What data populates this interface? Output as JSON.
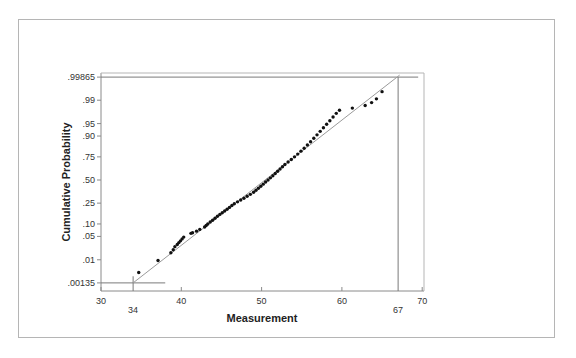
{
  "chart_data": {
    "type": "scatter",
    "subtype": "normal-probability-plot",
    "title": "",
    "xlabel": "Measurement",
    "ylabel": "Cumulative Probability",
    "xlim": [
      30,
      70
    ],
    "x_ticks": [
      30,
      40,
      50,
      60,
      70
    ],
    "x_extra_labels": [
      34,
      67
    ],
    "y_scale": "probit",
    "y_ticks": [
      {
        "label": ".99865",
        "p": 0.99865
      },
      {
        "label": ".99",
        "p": 0.99
      },
      {
        "label": ".95",
        "p": 0.95
      },
      {
        "label": ".90",
        "p": 0.9
      },
      {
        "label": ".75",
        "p": 0.75
      },
      {
        "label": ".50",
        "p": 0.5
      },
      {
        "label": ".25",
        "p": 0.25
      },
      {
        "label": ".10",
        "p": 0.1
      },
      {
        "label": ".05",
        "p": 0.05
      },
      {
        "label": ".01",
        "p": 0.01
      },
      {
        "label": ".00135",
        "p": 0.00135
      }
    ],
    "grid": false,
    "legend": null,
    "reference_line": {
      "from": {
        "x": 34,
        "p": 0.00135
      },
      "to": {
        "x": 67,
        "p": 0.99865
      }
    },
    "reference_guides": [
      {
        "type": "horizontal",
        "p": 0.99865,
        "x_from": 30,
        "x_to": 69.5
      },
      {
        "type": "horizontal",
        "p": 0.00135,
        "x_from": 30,
        "x_to": 38
      },
      {
        "type": "vertical",
        "x": 34,
        "p_from": "axis",
        "p_to": 0.0025
      },
      {
        "type": "vertical",
        "x": 67,
        "p_from": "axis",
        "p_to": 0.99865
      }
    ],
    "points": [
      [
        34.7,
        0.0035
      ],
      [
        37.1,
        0.0095
      ],
      [
        38.7,
        0.017
      ],
      [
        39.0,
        0.021
      ],
      [
        39.2,
        0.026
      ],
      [
        39.5,
        0.03
      ],
      [
        39.7,
        0.034
      ],
      [
        39.9,
        0.038
      ],
      [
        40.1,
        0.043
      ],
      [
        40.3,
        0.048
      ],
      [
        41.2,
        0.06
      ],
      [
        41.4,
        0.062
      ],
      [
        41.9,
        0.068
      ],
      [
        42.3,
        0.075
      ],
      [
        42.9,
        0.085
      ],
      [
        43.1,
        0.092
      ],
      [
        43.3,
        0.1
      ],
      [
        43.6,
        0.11
      ],
      [
        43.9,
        0.12
      ],
      [
        44.2,
        0.132
      ],
      [
        44.5,
        0.145
      ],
      [
        44.8,
        0.158
      ],
      [
        45.1,
        0.17
      ],
      [
        45.4,
        0.183
      ],
      [
        45.7,
        0.197
      ],
      [
        46.0,
        0.212
      ],
      [
        46.3,
        0.228
      ],
      [
        46.6,
        0.245
      ],
      [
        47.0,
        0.262
      ],
      [
        47.4,
        0.28
      ],
      [
        47.8,
        0.298
      ],
      [
        48.2,
        0.318
      ],
      [
        48.6,
        0.338
      ],
      [
        49.0,
        0.36
      ],
      [
        49.3,
        0.382
      ],
      [
        49.6,
        0.405
      ],
      [
        49.9,
        0.428
      ],
      [
        50.2,
        0.452
      ],
      [
        50.5,
        0.476
      ],
      [
        50.8,
        0.5
      ],
      [
        51.1,
        0.525
      ],
      [
        51.4,
        0.55
      ],
      [
        51.7,
        0.575
      ],
      [
        52.0,
        0.6
      ],
      [
        52.3,
        0.625
      ],
      [
        52.6,
        0.65
      ],
      [
        52.9,
        0.675
      ],
      [
        53.3,
        0.7
      ],
      [
        53.7,
        0.725
      ],
      [
        54.1,
        0.75
      ],
      [
        54.5,
        0.775
      ],
      [
        54.9,
        0.8
      ],
      [
        55.3,
        0.823
      ],
      [
        55.7,
        0.846
      ],
      [
        56.1,
        0.868
      ],
      [
        56.5,
        0.888
      ],
      [
        56.9,
        0.906
      ],
      [
        57.3,
        0.922
      ],
      [
        57.7,
        0.936
      ],
      [
        58.1,
        0.948
      ],
      [
        58.5,
        0.958
      ],
      [
        58.9,
        0.967
      ],
      [
        59.3,
        0.974
      ],
      [
        59.7,
        0.979
      ],
      [
        61.3,
        0.982
      ],
      [
        62.9,
        0.985
      ],
      [
        63.7,
        0.988
      ],
      [
        64.3,
        0.991
      ],
      [
        65.0,
        0.995
      ]
    ]
  },
  "axes": {
    "x_title": "Measurement",
    "y_title": "Cumulative Probability",
    "x_tick_labels": [
      "30",
      "40",
      "50",
      "60",
      "70"
    ],
    "x_extra_labels": [
      "34",
      "67"
    ],
    "y_tick_labels": [
      ".99865",
      ".99",
      ".95",
      ".90",
      ".75",
      ".50",
      ".25",
      ".10",
      ".05",
      ".01",
      ".00135"
    ]
  },
  "colors": {
    "axis": "#8a8a8a",
    "points": "#111111",
    "reference_line": "#9a9a9a",
    "frame": "#b5b5b5"
  }
}
